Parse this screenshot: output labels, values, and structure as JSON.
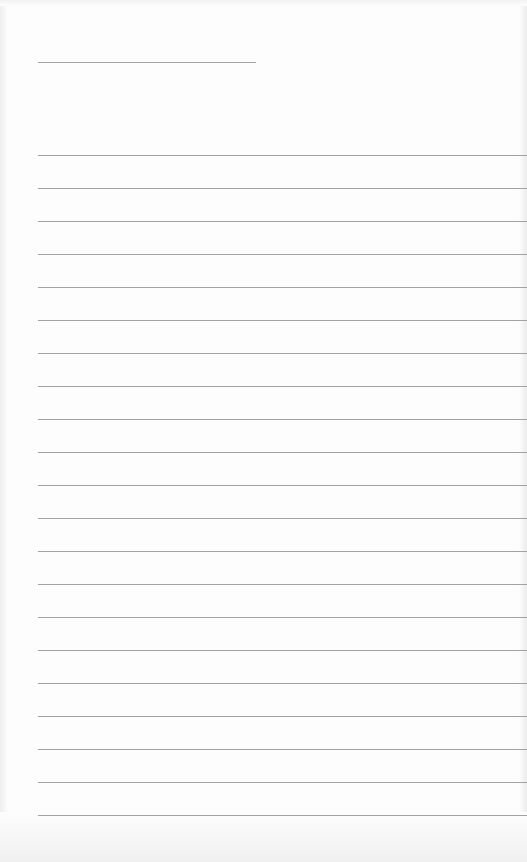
{
  "page": {
    "type": "lined-paper",
    "background_color": "#fdfdfd",
    "line_color": "#a2a2a2",
    "title_line": {
      "x_start": 38,
      "x_end": 256,
      "y": 62
    },
    "ruled_lines": {
      "count": 21,
      "x_start": 38,
      "first_y": 155,
      "spacing": 33
    }
  }
}
